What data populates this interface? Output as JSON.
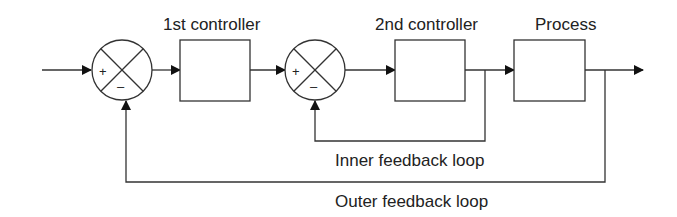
{
  "diagram": {
    "blocks": [
      {
        "id": "first_controller",
        "label": "1st controller"
      },
      {
        "id": "second_controller",
        "label": "2nd controller"
      },
      {
        "id": "process",
        "label": "Process"
      }
    ],
    "summing_junctions": [
      {
        "id": "sum1",
        "plus": "+",
        "minus": "–"
      },
      {
        "id": "sum2",
        "plus": "+",
        "minus": "–"
      }
    ],
    "loops": {
      "inner": "Inner feedback loop",
      "outer": "Outer feedback loop"
    },
    "colors": {
      "stroke": "#222222",
      "background": "#ffffff"
    }
  }
}
